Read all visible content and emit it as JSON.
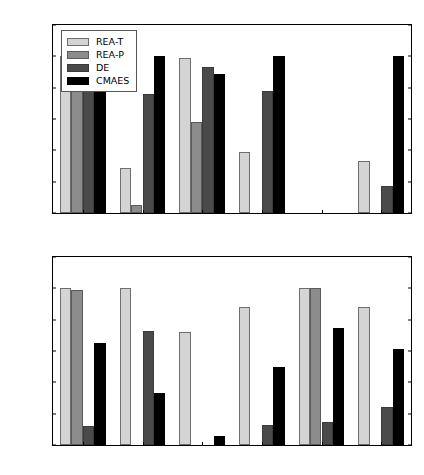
{
  "chart_data": [
    {
      "panel": "top",
      "type": "bar",
      "title": "",
      "xlabel": "",
      "ylabel": "",
      "ylim": [
        0.0,
        1.2
      ],
      "yticks": [
        0.0,
        0.2,
        0.4,
        0.6,
        0.8,
        1.0,
        1.2
      ],
      "ytick_labels": [
        "0.0",
        "0.2",
        "0.4",
        "0.6",
        "0.8",
        "1.0",
        "1.2"
      ],
      "grid": false,
      "legend_position": "upper left",
      "categories": [
        "sphere",
        "ackley",
        "log-ackley",
        "rastrigin",
        "salomon",
        "griewank"
      ],
      "series": [
        {
          "name": "REA-T",
          "color": "#d4d4d4",
          "values": [
            1.0,
            0.29,
            0.99,
            0.39,
            0.0,
            0.33
          ]
        },
        {
          "name": "REA-P",
          "color": "#8c8c8c",
          "values": [
            1.0,
            0.05,
            0.58,
            0.0,
            0.0,
            0.0
          ]
        },
        {
          "name": "DE",
          "color": "#4a4a4a",
          "values": [
            1.0,
            0.76,
            0.93,
            0.78,
            0.0,
            0.17
          ]
        },
        {
          "name": "CMAES",
          "color": "#000000",
          "values": [
            1.0,
            1.0,
            0.89,
            1.0,
            0.0,
            1.0
          ]
        }
      ]
    },
    {
      "panel": "bottom",
      "type": "bar",
      "title": "",
      "xlabel": "",
      "ylabel": "",
      "ylim": [
        0.0,
        1.2
      ],
      "yticks": [
        0.0,
        0.2,
        0.4,
        0.6,
        0.8,
        1.0,
        1.2
      ],
      "ytick_labels": [
        "0.0",
        "0.2",
        "0.4",
        "0.6",
        "0.8",
        "1.0",
        "1.2"
      ],
      "grid": false,
      "legend_position": "none",
      "categories": [
        "rosenbrock",
        "schwefel",
        "shekel",
        "langerman",
        "whitley",
        "weierstrass"
      ],
      "series": [
        {
          "name": "REA-T",
          "color": "#d4d4d4",
          "values": [
            1.0,
            1.0,
            0.72,
            0.88,
            1.0,
            0.88
          ]
        },
        {
          "name": "REA-P",
          "color": "#8c8c8c",
          "values": [
            0.99,
            0.0,
            0.0,
            0.0,
            1.0,
            0.0
          ]
        },
        {
          "name": "DE",
          "color": "#4a4a4a",
          "values": [
            0.12,
            0.73,
            0.0,
            0.13,
            0.15,
            0.24
          ]
        },
        {
          "name": "CMAES",
          "color": "#000000",
          "values": [
            0.65,
            0.33,
            0.06,
            0.5,
            0.75,
            0.61
          ]
        }
      ]
    }
  ],
  "legend": {
    "items": [
      {
        "label": "REA-T"
      },
      {
        "label": "REA-P"
      },
      {
        "label": "DE"
      },
      {
        "label": "CMAES"
      }
    ]
  }
}
